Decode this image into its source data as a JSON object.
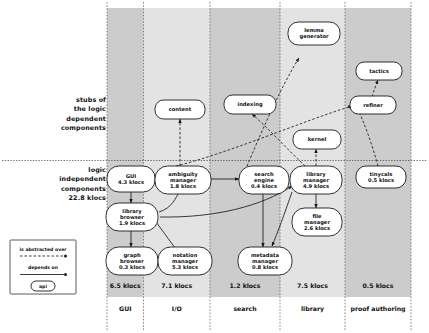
{
  "diagram": {
    "side_labels": {
      "upper": "stubs of\nthe logic\ndependent\ncomponents",
      "lower": "logic\nindependent\ncomponents\n22.8 klocs"
    },
    "legend": {
      "abstracted_label": "is abstracted over",
      "depends_label": "depends on",
      "api_label": "api"
    },
    "columns": [
      {
        "id": "gui",
        "name": "GUI",
        "total": "6.5 klocs",
        "shaded": true
      },
      {
        "id": "io",
        "name": "I/O",
        "total": "7.1 klocs",
        "shaded": false
      },
      {
        "id": "search",
        "name": "search",
        "total": "1.2 klocs",
        "shaded": true
      },
      {
        "id": "lib",
        "name": "library",
        "total": "7.5 klocs",
        "shaded": false
      },
      {
        "id": "proof",
        "name": "proof authoring",
        "total": "0.5 klocs",
        "shaded": true
      }
    ],
    "stub_nodes": [
      {
        "id": "content",
        "label": "content",
        "sub": ""
      },
      {
        "id": "indexing",
        "label": "indexing",
        "sub": ""
      },
      {
        "id": "kernel",
        "label": "kernel",
        "sub": ""
      },
      {
        "id": "lemmagen",
        "label": "lemma",
        "sub": "generator"
      },
      {
        "id": "tactics",
        "label": "tactics",
        "sub": ""
      },
      {
        "id": "refiner",
        "label": "refiner",
        "sub": ""
      }
    ],
    "component_nodes": [
      {
        "id": "gui",
        "l1": "GUI",
        "l2": "4.3 klocs",
        "l3": ""
      },
      {
        "id": "libbrow",
        "l1": "library",
        "l2": "browser",
        "l3": "1.9 klocs"
      },
      {
        "id": "graphbrow",
        "l1": "graph",
        "l2": "browser",
        "l3": "0.3 klocs"
      },
      {
        "id": "ambig",
        "l1": "ambiguity",
        "l2": "manager",
        "l3": "1.8 klocs"
      },
      {
        "id": "notation",
        "l1": "notation",
        "l2": "manager",
        "l3": "5.3 klocs"
      },
      {
        "id": "searcheng",
        "l1": "search",
        "l2": "engine",
        "l3": "0.4 klocs"
      },
      {
        "id": "metadata",
        "l1": "metadata",
        "l2": "manager",
        "l3": "0.8 klocs"
      },
      {
        "id": "libmgr",
        "l1": "library",
        "l2": "manager",
        "l3": "4.9 klocs"
      },
      {
        "id": "filemgr",
        "l1": "file",
        "l2": "manager",
        "l3": "2.6 klocs"
      },
      {
        "id": "tinycals",
        "l1": "tinycals",
        "l2": "0.5 klocs",
        "l3": ""
      }
    ],
    "colors": {
      "band_shaded": "#cccccc",
      "band_light": "#e3e3e3",
      "node_fill": "#ffffff",
      "stroke": "#1a1a1a",
      "page_bg": "#ffffff"
    }
  }
}
